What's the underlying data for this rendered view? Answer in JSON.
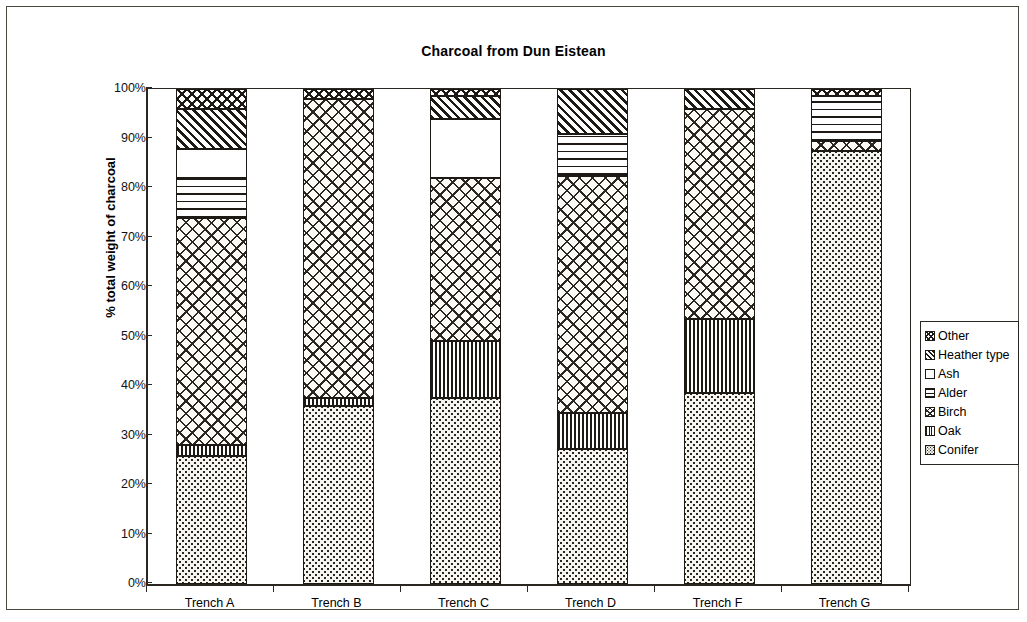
{
  "page": {
    "frame_color": "#4a4640",
    "background": "#ffffff"
  },
  "chart_data": {
    "type": "bar",
    "subtype": "stacked-100pct-vertical",
    "title": "Charcoal from Dun Eistean",
    "subtitle": "",
    "xlabel": "",
    "ylabel": "% total weight of charcoal",
    "categories": [
      "Trench A",
      "Trench B",
      "Trench C",
      "Trench D",
      "Trench F",
      "Trench G"
    ],
    "ylim": [
      0,
      100
    ],
    "ytick_labels": [
      "0%",
      "10%",
      "20%",
      "30%",
      "40%",
      "50%",
      "60%",
      "70%",
      "80%",
      "90%",
      "100%"
    ],
    "ytick_values": [
      0,
      10,
      20,
      30,
      40,
      50,
      60,
      70,
      80,
      90,
      100
    ],
    "grid": false,
    "legend_position": "right",
    "legend_order_top_to_bottom": [
      "Other",
      "Heather type",
      "Ash",
      "Alder",
      "Birch",
      "Oak",
      "Conifer"
    ],
    "stack_order_bottom_to_top": [
      "Conifer",
      "Oak",
      "Birch",
      "Alder",
      "Ash",
      "Heather type",
      "Other"
    ],
    "series": [
      {
        "name": "Conifer",
        "pattern": "fine-dots",
        "values": [
          25.8,
          36.0,
          37.5,
          27.3,
          38.5,
          87.5
        ]
      },
      {
        "name": "Oak",
        "pattern": "vertical-lines",
        "values": [
          2.2,
          1.5,
          11.5,
          7.2,
          15.0,
          0.0
        ]
      },
      {
        "name": "Birch",
        "pattern": "diagonal-crosshatch",
        "values": [
          46.0,
          60.5,
          33.0,
          48.0,
          42.5,
          2.0
        ]
      },
      {
        "name": "Alder",
        "pattern": "horizontal-lines",
        "values": [
          8.0,
          0.0,
          0.0,
          8.5,
          0.0,
          9.0
        ]
      },
      {
        "name": "Ash",
        "pattern": "solid-white",
        "values": [
          5.8,
          0.0,
          12.0,
          0.0,
          0.0,
          0.0
        ]
      },
      {
        "name": "Heather type",
        "pattern": "diagonal-stripes",
        "values": [
          8.2,
          0.0,
          4.5,
          9.0,
          4.0,
          0.0
        ]
      },
      {
        "name": "Other",
        "pattern": "zigzag",
        "values": [
          4.0,
          2.0,
          1.5,
          0.0,
          0.0,
          1.5
        ]
      }
    ]
  },
  "legend": {
    "items": [
      {
        "label": "Other",
        "swatch": "other"
      },
      {
        "label": "Heather type",
        "swatch": "heather"
      },
      {
        "label": "Ash",
        "swatch": "ash"
      },
      {
        "label": "Alder",
        "swatch": "alder"
      },
      {
        "label": "Birch",
        "swatch": "birch"
      },
      {
        "label": "Oak",
        "swatch": "oak"
      },
      {
        "label": "Conifer",
        "swatch": "conifer"
      }
    ]
  }
}
